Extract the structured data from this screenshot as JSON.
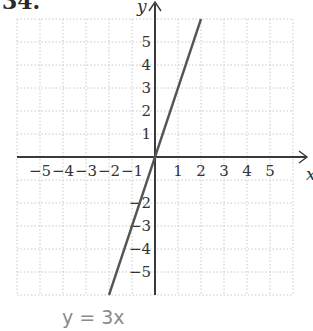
{
  "problem": {
    "number": "34."
  },
  "caption": {
    "text": "y = 3x",
    "color": "#8a8a8a"
  },
  "colors": {
    "axis": "#3a3a3a",
    "line": "#555555",
    "grid": "#c8c8c8",
    "tick_label": "#333333"
  },
  "chart_data": {
    "type": "line",
    "title": "",
    "caption": "y = 3x",
    "equation": "y = 3x",
    "xlabel": "x",
    "ylabel": "y",
    "xlim": [
      -6,
      6
    ],
    "ylim": [
      -6,
      6
    ],
    "grid": true,
    "grid_style": "dotted",
    "x_ticks": [
      -5,
      -4,
      -3,
      -2,
      -1,
      1,
      2,
      3,
      4,
      5
    ],
    "x_tick_labels": [
      "−5",
      "−4",
      "−3",
      "−2",
      "−1",
      "1",
      "2",
      "3",
      "4",
      "5"
    ],
    "y_ticks": [
      5,
      4,
      3,
      2,
      1,
      -2,
      -3,
      -4,
      -5
    ],
    "y_tick_labels": [
      "5",
      "4",
      "3",
      "2",
      "1",
      "−2",
      "−3",
      "−4",
      "−5"
    ],
    "series": [
      {
        "name": "y = 3x",
        "x": [
          -2,
          -1,
          0,
          1,
          2
        ],
        "y": [
          -6,
          -3,
          0,
          3,
          6
        ]
      }
    ],
    "legend": null
  }
}
